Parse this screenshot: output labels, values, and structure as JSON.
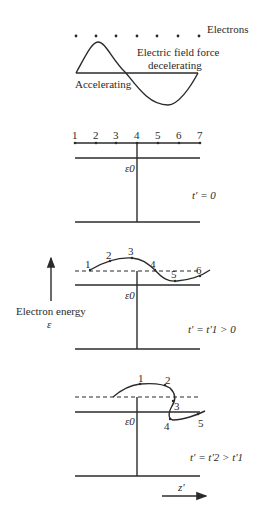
{
  "top": {
    "electrons_label": "Electrons",
    "force_label_line1": "Electric field force",
    "force_label_line2": "decelerating",
    "accelerating_label": "Accelerating"
  },
  "panel1": {
    "positions": [
      "1",
      "2",
      "3",
      "4",
      "5",
      "6",
      "7"
    ],
    "energy_label": "ε0",
    "time_label": "t' = 0"
  },
  "panel2": {
    "points": [
      "1",
      "2",
      "3",
      "4",
      "5",
      "6"
    ],
    "energy_label": "ε0",
    "time_label": "t' = t'1 > 0"
  },
  "panel3": {
    "points": [
      "1",
      "2",
      "3",
      "4",
      "5"
    ],
    "energy_label": "ε0",
    "time_label": "t' = t'2 > t'1"
  },
  "axis": {
    "energy_axis_label": "Electron energy",
    "energy_symbol": "ε",
    "z_axis_label": "z'"
  }
}
